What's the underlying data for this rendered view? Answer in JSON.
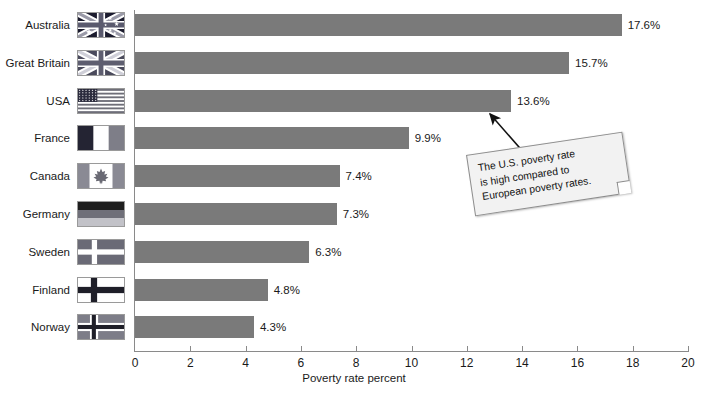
{
  "chart_data": {
    "type": "bar",
    "orientation": "horizontal",
    "title": "",
    "xlabel": "Poverty rate percent",
    "ylabel": "",
    "xlim": [
      0,
      20
    ],
    "xticks": [
      0,
      2,
      4,
      6,
      8,
      10,
      12,
      14,
      16,
      18,
      20
    ],
    "grid": false,
    "legend": null,
    "bar_color": "#7a7a7a",
    "categories": [
      "Australia",
      "Great Britain",
      "USA",
      "France",
      "Canada",
      "Germany",
      "Sweden",
      "Finland",
      "Norway"
    ],
    "values": [
      17.6,
      15.7,
      13.6,
      9.9,
      7.4,
      7.3,
      6.3,
      4.8,
      4.3
    ],
    "value_labels": [
      "17.6%",
      "15.7%",
      "13.6%",
      "9.9%",
      "7.4%",
      "7.3%",
      "6.3%",
      "4.8%",
      "4.3%"
    ],
    "annotations": [
      {
        "text": "The U.S. poverty rate is high compared to European poverty rates.",
        "lines": [
          "The U.S. poverty rate",
          "is high compared to",
          "European poverty rates."
        ],
        "points_to": "USA"
      }
    ]
  },
  "rows": [
    {
      "label": "Australia",
      "value": 17.6,
      "value_label": "17.6%",
      "flag": "flag-australia"
    },
    {
      "label": "Great Britain",
      "value": 15.7,
      "value_label": "15.7%",
      "flag": "flag-great-britain"
    },
    {
      "label": "USA",
      "value": 13.6,
      "value_label": "13.6%",
      "flag": "flag-usa"
    },
    {
      "label": "France",
      "value": 9.9,
      "value_label": "9.9%",
      "flag": "flag-france"
    },
    {
      "label": "Canada",
      "value": 7.4,
      "value_label": "7.4%",
      "flag": "flag-canada"
    },
    {
      "label": "Germany",
      "value": 7.3,
      "value_label": "7.3%",
      "flag": "flag-germany"
    },
    {
      "label": "Sweden",
      "value": 6.3,
      "value_label": "6.3%",
      "flag": "flag-sweden"
    },
    {
      "label": "Finland",
      "value": 4.8,
      "value_label": "4.8%",
      "flag": "flag-finland"
    },
    {
      "label": "Norway",
      "value": 4.3,
      "value_label": "4.3%",
      "flag": "flag-norway"
    }
  ],
  "axis": {
    "title": "Poverty rate percent",
    "ticks": [
      "0",
      "2",
      "4",
      "6",
      "8",
      "10",
      "12",
      "14",
      "16",
      "18",
      "20"
    ]
  },
  "note": {
    "line1": "The U.S. poverty rate",
    "line2": "is high compared to",
    "line3": "European poverty rates."
  }
}
